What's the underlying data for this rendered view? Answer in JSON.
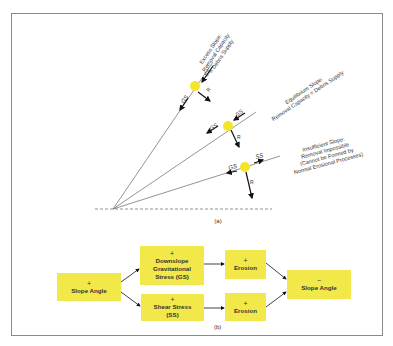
{
  "colors": {
    "ball": "#f5e52a",
    "box": "#f2e84a",
    "line": "#555555",
    "arrow": "#111111",
    "frame": "#8a8a8a"
  },
  "part_a": {
    "caption": "(a)",
    "slopes": [
      {
        "name": "excess",
        "label_lines": [
          "Excess Slope:",
          "Removal Capacity",
          "> Debris Supply"
        ],
        "forces": {
          "gs": "GS",
          "ss": "SS",
          "r": "R"
        }
      },
      {
        "name": "equilibrium",
        "label_lines": [
          "Equilibrium Slope:",
          "Removal Capacity = Debris Supply"
        ],
        "forces": {
          "gs": "GS",
          "ss": "SS",
          "r": "R"
        }
      },
      {
        "name": "insufficient",
        "label_lines": [
          "Insufficient Slope:",
          "Removal Impossible",
          "(Cannot be Formed by",
          "Normal Erosional Processes)"
        ],
        "forces": {
          "gs": "GS",
          "ss": "SS",
          "r": "R"
        }
      }
    ]
  },
  "part_b": {
    "caption": "(b)",
    "boxes": {
      "slope_angle_in": {
        "sign": "+",
        "lines": [
          "Slope Angle"
        ]
      },
      "downslope": {
        "sign": "+",
        "lines": [
          "Downslope",
          "Gravitational",
          "Stress (GS)"
        ]
      },
      "shear": {
        "sign": "+",
        "lines": [
          "Shear Stress",
          "(SS)"
        ]
      },
      "erosion_top": {
        "sign": "+",
        "lines": [
          "Erosion"
        ]
      },
      "erosion_bottom": {
        "sign": "+",
        "lines": [
          "Erosion"
        ]
      },
      "slope_angle_out": {
        "sign": "−",
        "lines": [
          "Slope Angle"
        ]
      }
    }
  }
}
